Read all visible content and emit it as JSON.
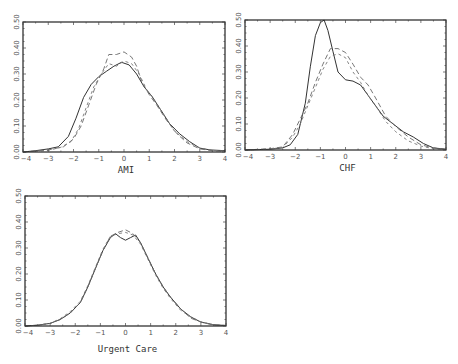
{
  "chart_data": [
    {
      "type": "line",
      "title": "",
      "xlabel": "AMI",
      "ylabel": "",
      "xlim": [
        -4,
        4
      ],
      "ylim": [
        0,
        0.5
      ],
      "xticks": [
        "-4",
        "-3",
        "-2",
        "-1",
        "0",
        "1",
        "2",
        "3",
        "4"
      ],
      "yticks": [
        "0.00",
        "0.10",
        "0.20",
        "0.30",
        "0.40",
        "0.50"
      ],
      "frame": {
        "x0": 23,
        "x1": 225,
        "y0": 22,
        "y1": 152
      },
      "series": [
        {
          "name": "solid",
          "style": "solid",
          "x": [
            -4,
            -3.5,
            -3,
            -2.6,
            -2.2,
            -1.9,
            -1.6,
            -1.3,
            -1.0,
            -0.7,
            -0.4,
            -0.1,
            0.2,
            0.5,
            0.8,
            1.1,
            1.4,
            1.8,
            2.2,
            2.6,
            3.0,
            3.4,
            4.0
          ],
          "y": [
            0.0,
            0.005,
            0.012,
            0.02,
            0.06,
            0.13,
            0.21,
            0.26,
            0.29,
            0.31,
            0.33,
            0.345,
            0.335,
            0.3,
            0.25,
            0.215,
            0.17,
            0.11,
            0.07,
            0.04,
            0.015,
            0.008,
            0.005
          ]
        },
        {
          "name": "dashed-1",
          "style": "dash1",
          "x": [
            -4,
            -3,
            -2.4,
            -2.0,
            -1.7,
            -1.4,
            -1.1,
            -0.8,
            -0.6,
            -0.3,
            0.0,
            0.3,
            0.5,
            0.7,
            1.0,
            1.3,
            1.7,
            2.1,
            2.5,
            3.0,
            3.5,
            4.0
          ],
          "y": [
            0.0,
            0.008,
            0.02,
            0.05,
            0.1,
            0.18,
            0.26,
            0.32,
            0.375,
            0.375,
            0.385,
            0.365,
            0.33,
            0.27,
            0.22,
            0.18,
            0.12,
            0.07,
            0.035,
            0.012,
            0.005,
            0.003
          ]
        },
        {
          "name": "dashed-2",
          "style": "dash2",
          "x": [
            -4,
            -3,
            -2.5,
            -2.1,
            -1.8,
            -1.5,
            -1.2,
            -0.9,
            -0.6,
            -0.3,
            0.0,
            0.3,
            0.6,
            0.9,
            1.2,
            1.6,
            2.0,
            2.5,
            3.0,
            3.5,
            4.0
          ],
          "y": [
            0.0,
            0.006,
            0.018,
            0.04,
            0.09,
            0.17,
            0.25,
            0.3,
            0.34,
            0.33,
            0.35,
            0.34,
            0.3,
            0.24,
            0.2,
            0.14,
            0.08,
            0.04,
            0.015,
            0.006,
            0.004
          ]
        }
      ]
    },
    {
      "type": "line",
      "title": "",
      "xlabel": "CHF",
      "ylabel": "",
      "xlim": [
        -4,
        4
      ],
      "ylim": [
        0,
        0.5
      ],
      "xticks": [
        "-4",
        "-3",
        "-2",
        "-1",
        "0",
        "1",
        "2",
        "3",
        "4"
      ],
      "yticks": [
        "0.00",
        "0.10",
        "0.20",
        "0.30",
        "0.40",
        "0.50"
      ],
      "frame": {
        "x0": 245,
        "x1": 446,
        "y0": 20,
        "y1": 150
      },
      "series": [
        {
          "name": "solid",
          "style": "solid",
          "x": [
            -4,
            -3,
            -2.5,
            -2.2,
            -1.9,
            -1.6,
            -1.4,
            -1.2,
            -1.0,
            -0.85,
            -0.7,
            -0.5,
            -0.3,
            0.0,
            0.3,
            0.6,
            0.9,
            1.2,
            1.5,
            1.9,
            2.3,
            2.7,
            3.1,
            3.5,
            4.0
          ],
          "y": [
            0.0,
            0.003,
            0.008,
            0.02,
            0.06,
            0.18,
            0.32,
            0.44,
            0.49,
            0.5,
            0.46,
            0.38,
            0.3,
            0.27,
            0.265,
            0.25,
            0.21,
            0.17,
            0.13,
            0.1,
            0.07,
            0.05,
            0.025,
            0.008,
            0.003
          ]
        },
        {
          "name": "dashed-1",
          "style": "dash1",
          "x": [
            -4,
            -3,
            -2.5,
            -2.1,
            -1.8,
            -1.5,
            -1.2,
            -0.9,
            -0.6,
            -0.3,
            0.0,
            0.3,
            0.6,
            0.9,
            1.2,
            1.6,
            2.0,
            2.5,
            3.0,
            3.5,
            4.0
          ],
          "y": [
            0.0,
            0.005,
            0.012,
            0.06,
            0.12,
            0.18,
            0.26,
            0.33,
            0.39,
            0.39,
            0.375,
            0.33,
            0.28,
            0.25,
            0.2,
            0.13,
            0.09,
            0.05,
            0.02,
            0.008,
            0.003
          ]
        },
        {
          "name": "dashed-2",
          "style": "dash2",
          "x": [
            -4,
            -3,
            -2.5,
            -2.1,
            -1.8,
            -1.5,
            -1.2,
            -0.9,
            -0.6,
            -0.3,
            0.0,
            0.3,
            0.6,
            0.9,
            1.2,
            1.6,
            2.0,
            2.5,
            3.0,
            3.5,
            4.0
          ],
          "y": [
            0.0,
            0.004,
            0.01,
            0.05,
            0.1,
            0.17,
            0.24,
            0.31,
            0.36,
            0.37,
            0.355,
            0.3,
            0.26,
            0.21,
            0.17,
            0.11,
            0.07,
            0.035,
            0.015,
            0.005,
            0.002
          ]
        }
      ]
    },
    {
      "type": "line",
      "title": "",
      "xlabel": "Urgent Care",
      "ylabel": "",
      "xlim": [
        -4,
        4
      ],
      "ylim": [
        0,
        0.5
      ],
      "xticks": [
        "-4",
        "-3",
        "-2",
        "-1",
        "0",
        "1",
        "2",
        "3",
        "4"
      ],
      "yticks": [
        "0.00",
        "0.10",
        "0.20",
        "0.30",
        "0.40",
        "0.50"
      ],
      "frame": {
        "x0": 25,
        "x1": 226,
        "y0": 196,
        "y1": 326
      },
      "series": [
        {
          "name": "solid",
          "style": "solid",
          "x": [
            -4,
            -3.5,
            -3.0,
            -2.6,
            -2.2,
            -1.8,
            -1.5,
            -1.2,
            -0.9,
            -0.6,
            -0.4,
            -0.2,
            0.0,
            0.2,
            0.4,
            0.6,
            0.9,
            1.2,
            1.5,
            1.8,
            2.2,
            2.6,
            3.0,
            3.5,
            4.0
          ],
          "y": [
            0.0,
            0.003,
            0.01,
            0.025,
            0.05,
            0.09,
            0.15,
            0.22,
            0.29,
            0.34,
            0.355,
            0.34,
            0.33,
            0.34,
            0.35,
            0.32,
            0.26,
            0.2,
            0.15,
            0.11,
            0.065,
            0.035,
            0.015,
            0.005,
            0.002
          ]
        },
        {
          "name": "dashed-1",
          "style": "dash1",
          "x": [
            -4,
            -3.5,
            -3.0,
            -2.6,
            -2.2,
            -1.8,
            -1.5,
            -1.2,
            -0.9,
            -0.6,
            -0.3,
            0.0,
            0.3,
            0.6,
            0.9,
            1.2,
            1.5,
            1.8,
            2.2,
            2.6,
            3.0,
            3.5,
            4.0
          ],
          "y": [
            0.0,
            0.003,
            0.01,
            0.025,
            0.05,
            0.09,
            0.15,
            0.22,
            0.29,
            0.345,
            0.36,
            0.37,
            0.355,
            0.32,
            0.26,
            0.2,
            0.15,
            0.11,
            0.065,
            0.03,
            0.015,
            0.004,
            0.002
          ]
        },
        {
          "name": "dashed-2",
          "style": "dash2",
          "x": [
            -4,
            -3.5,
            -3.0,
            -2.6,
            -2.2,
            -1.8,
            -1.5,
            -1.2,
            -0.9,
            -0.6,
            -0.3,
            0.0,
            0.3,
            0.6,
            0.9,
            1.2,
            1.5,
            1.8,
            2.2,
            2.6,
            3.0,
            3.5,
            4.0
          ],
          "y": [
            0.0,
            0.003,
            0.01,
            0.028,
            0.055,
            0.095,
            0.155,
            0.225,
            0.295,
            0.345,
            0.355,
            0.36,
            0.35,
            0.315,
            0.255,
            0.195,
            0.145,
            0.105,
            0.06,
            0.035,
            0.016,
            0.005,
            0.002
          ]
        }
      ]
    }
  ]
}
